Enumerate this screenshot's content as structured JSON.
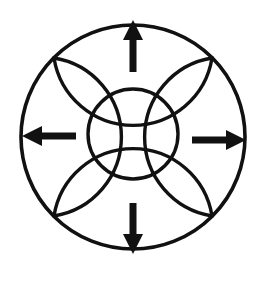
{
  "figure": {
    "background_color": "#ffffff",
    "stroke_color": "#111111",
    "arrow_color": "#111111",
    "canvas": {
      "width": 264,
      "height": 289
    }
  },
  "geometry": {
    "center": {
      "x": 133,
      "y": 137
    },
    "outer_circle": {
      "cx": 133,
      "cy": 137,
      "r": 112,
      "stroke_width": 3.6
    },
    "inner_circle": {
      "cx": 133,
      "cy": 134,
      "r": 45,
      "stroke_width": 3.4
    },
    "petal_stroke_width": 3.4
  },
  "petals": [
    {
      "name": "top-petal",
      "position": "top",
      "bulge_direction": "down",
      "path": "M 54 58 A 80 80 0 0 0 212 58"
    },
    {
      "name": "right-petal",
      "position": "right",
      "bulge_direction": "left",
      "path": "M 212 58 A 80 80 0 0 0 212 216"
    },
    {
      "name": "bottom-petal",
      "position": "bottom",
      "bulge_direction": "up",
      "path": "M 212 216 A 80 80 0 0 0 54 216"
    },
    {
      "name": "left-petal",
      "position": "left",
      "bulge_direction": "right",
      "path": "M 54 216 A 80 80 0 0 0 54 58"
    }
  ],
  "arrows": [
    {
      "name": "arrow-up",
      "direction": "up",
      "label": "up-arrow",
      "tail": {
        "x": 133,
        "y": 72
      },
      "tip": {
        "x": 133,
        "y": 20
      },
      "shaft_width": 7,
      "head_width": 20,
      "head_length": 20
    },
    {
      "name": "arrow-right",
      "direction": "right",
      "label": "right-arrow",
      "tail": {
        "x": 192,
        "y": 140
      },
      "tip": {
        "x": 246,
        "y": 140
      },
      "shaft_width": 7,
      "head_width": 20,
      "head_length": 20
    },
    {
      "name": "arrow-down",
      "direction": "down",
      "label": "down-arrow",
      "tail": {
        "x": 133,
        "y": 203
      },
      "tip": {
        "x": 133,
        "y": 254
      },
      "shaft_width": 7,
      "head_width": 20,
      "head_length": 20
    },
    {
      "name": "arrow-left",
      "direction": "left",
      "label": "left-arrow",
      "tail": {
        "x": 76,
        "y": 136
      },
      "tip": {
        "x": 22,
        "y": 136
      },
      "shaft_width": 7,
      "head_width": 20,
      "head_length": 20
    }
  ]
}
